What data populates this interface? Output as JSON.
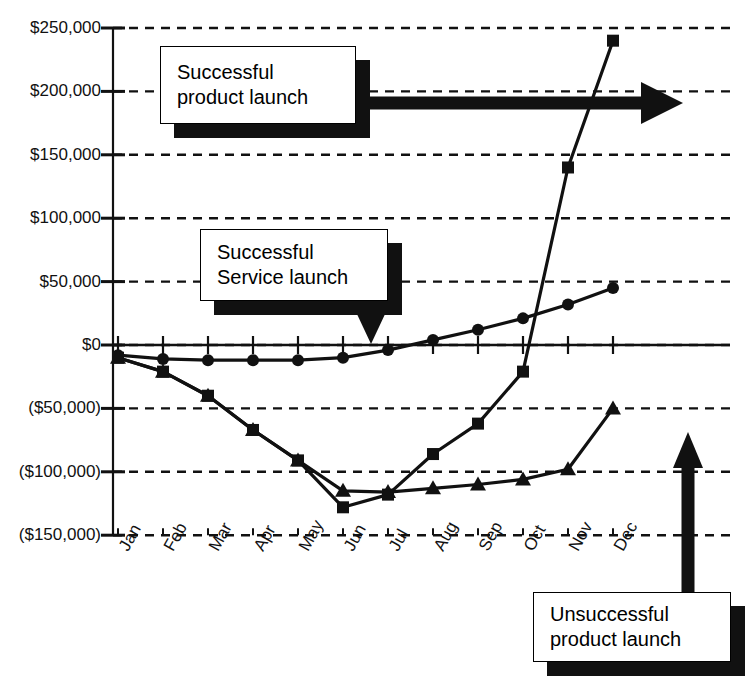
{
  "chart_data": {
    "type": "line",
    "title": "",
    "xlabel": "",
    "ylabel": "",
    "categories": [
      "Jan",
      "Feb",
      "Mar",
      "Apr",
      "May",
      "Jun",
      "Jul",
      "Aug",
      "Sep",
      "Oct",
      "Nov",
      "Dec"
    ],
    "ylim": [
      -150000,
      250000
    ],
    "yticks": [
      250000,
      200000,
      150000,
      100000,
      50000,
      0,
      -50000,
      -100000,
      -150000
    ],
    "ytick_labels": [
      "$250,000",
      "$200,000",
      "$150,000",
      "$100,000",
      "$50,000",
      "$0",
      "($50,000)",
      "($100,000)",
      "($150,000)"
    ],
    "grid": true,
    "legend": "none",
    "series": [
      {
        "name": "Successful service launch",
        "marker": "circle",
        "values": [
          -8000,
          -11000,
          -12000,
          -12000,
          -12000,
          -10000,
          -4000,
          4000,
          12000,
          21000,
          32000,
          45000
        ]
      },
      {
        "name": "Successful product launch",
        "marker": "square",
        "values": [
          -10000,
          -21000,
          -40000,
          -67000,
          -91000,
          -128000,
          -118000,
          -86000,
          -62000,
          -21000,
          140000,
          240000
        ]
      },
      {
        "name": "Unsuccessful product launch",
        "marker": "triangle",
        "values": [
          -10000,
          -21000,
          -40000,
          -67000,
          -91000,
          -115000,
          -116000,
          -113000,
          -110000,
          -106000,
          -98000,
          -50000
        ]
      }
    ],
    "annotations": [
      {
        "id": "successful-product-launch",
        "lines": [
          "Successful",
          "product launch"
        ],
        "pointer": "arrow-right"
      },
      {
        "id": "successful-service-launch",
        "lines": [
          "Successful",
          "Service launch"
        ],
        "pointer": "arrow-down"
      },
      {
        "id": "unsuccessful-product-launch",
        "lines": [
          "Unsuccessful",
          "product launch"
        ],
        "pointer": "arrow-up"
      }
    ]
  },
  "colors": {
    "ink": "#000000",
    "grid": "#111111",
    "background": "#ffffff"
  }
}
